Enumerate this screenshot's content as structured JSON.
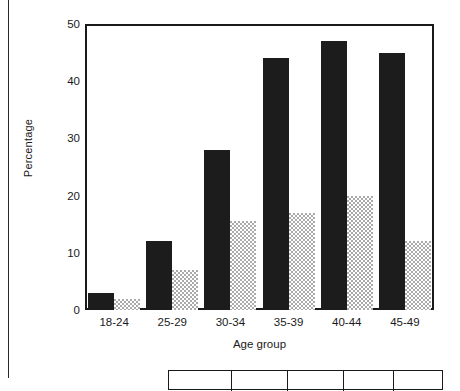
{
  "chart_data": {
    "type": "bar",
    "title": "",
    "xlabel": "Age group",
    "ylabel": "Percentage",
    "categories": [
      "18-24",
      "25-29",
      "30-34",
      "35-39",
      "40-44",
      "45-49"
    ],
    "series": [
      {
        "name": "series-dark",
        "color": "#1c1c1c",
        "values": [
          3,
          12,
          28,
          44,
          47,
          45
        ]
      },
      {
        "name": "series-light",
        "color": "#aaaaaa",
        "values": [
          2,
          7,
          15.5,
          17,
          20,
          12
        ]
      }
    ],
    "ylim": [
      0,
      50
    ],
    "yticks": [
      0,
      10,
      20,
      30,
      40,
      50
    ],
    "ytick_labels": [
      "0",
      "10",
      "20",
      "30",
      "40",
      "50"
    ],
    "grid": false,
    "legend": "none"
  },
  "axes": {
    "y_title": "Percentage",
    "x_title": "Age group"
  }
}
